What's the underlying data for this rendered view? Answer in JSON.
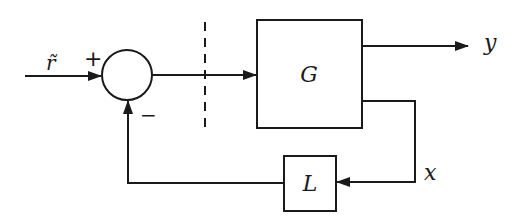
{
  "diagram": {
    "type": "feedback-block-diagram",
    "input_label": "r̃",
    "summing_junction": {
      "plus_sign": "+",
      "minus_sign": "−"
    },
    "blocks": [
      {
        "id": "G",
        "label": "G"
      },
      {
        "id": "L",
        "label": "L"
      }
    ],
    "output_label": "y",
    "state_label": "x",
    "loop_break": "dashed-line",
    "colors": {
      "stroke": "#1a1a1a",
      "background": "#ffffff"
    }
  }
}
